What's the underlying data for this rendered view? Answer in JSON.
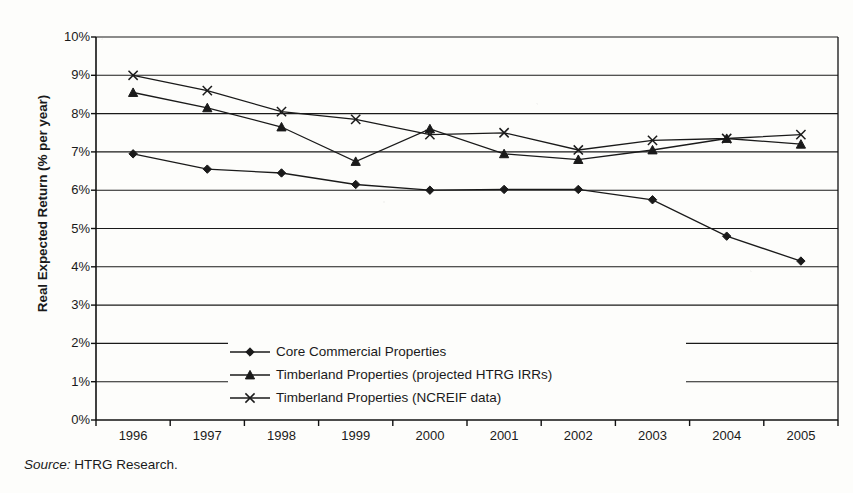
{
  "chart_data": {
    "type": "line",
    "title": "",
    "xlabel": "",
    "ylabel": "Real Expected Return (% per year)",
    "categories": [
      "1996",
      "1997",
      "1998",
      "1999",
      "2000",
      "2001",
      "2002",
      "2003",
      "2004",
      "2005"
    ],
    "ylim": [
      0,
      10
    ],
    "ytick_labels": [
      "10%",
      "9%",
      "8%",
      "7%",
      "6%",
      "5%",
      "4%",
      "3%",
      "2%",
      "1%",
      "0%"
    ],
    "ytick_values": [
      10,
      9,
      8,
      7,
      6,
      5,
      4,
      3,
      2,
      1,
      0
    ],
    "grid": "horizontal",
    "legend_position": "inside-lower-center",
    "series": [
      {
        "name": "Core Commercial Properties",
        "marker": "diamond",
        "color": "#1a1a1a",
        "values": [
          6.95,
          6.55,
          6.45,
          6.15,
          6.0,
          6.02,
          6.02,
          5.75,
          4.8,
          4.15
        ]
      },
      {
        "name": "Timberland Properties (projected HTRG IRRs)",
        "marker": "triangle",
        "color": "#1a1a1a",
        "values": [
          8.55,
          8.15,
          7.65,
          6.75,
          7.6,
          6.95,
          6.8,
          7.05,
          7.35,
          7.2
        ]
      },
      {
        "name": "Timberland Properties (NCREIF data)",
        "marker": "cross",
        "color": "#1a1a1a",
        "values": [
          9.0,
          8.6,
          8.05,
          7.85,
          7.45,
          7.5,
          7.05,
          7.3,
          7.35,
          7.45
        ]
      }
    ]
  },
  "source_note": {
    "label": "Source:",
    "text": "HTRG Research."
  },
  "colors": {
    "ink": "#1a1a1a",
    "paper": "#fdfdfb",
    "axis": "#111111"
  }
}
